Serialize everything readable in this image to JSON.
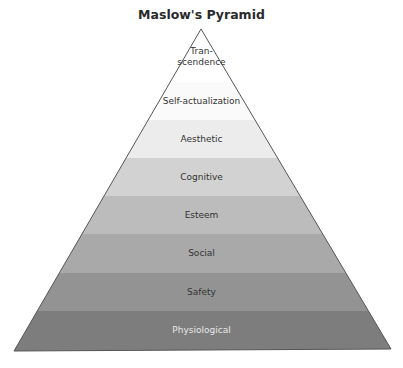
{
  "title": "Maslow's Pyramid",
  "pyramid": {
    "apex": [
      201,
      29
    ],
    "base_left": [
      14,
      351
    ],
    "base_right": [
      391,
      349
    ],
    "levels": [
      {
        "label": "Tran-\nscendence",
        "label_lines": [
          "Tran-",
          "scendence"
        ],
        "y_top": 29,
        "y_bottom": 82,
        "color": "#ffffff",
        "text_color": "#333333"
      },
      {
        "label": "Self-actualization",
        "y_top": 82,
        "y_bottom": 120,
        "color": "#fafafa",
        "text_color": "#333333"
      },
      {
        "label": "Aesthetic",
        "y_top": 120,
        "y_bottom": 158,
        "color": "#ececec",
        "text_color": "#333333"
      },
      {
        "label": "Cognitive",
        "y_top": 158,
        "y_bottom": 196,
        "color": "#d2d2d2",
        "text_color": "#333333"
      },
      {
        "label": "Esteem",
        "y_top": 196,
        "y_bottom": 234,
        "color": "#bcbcbc",
        "text_color": "#333333"
      },
      {
        "label": "Social",
        "y_top": 234,
        "y_bottom": 273,
        "color": "#a9a9a9",
        "text_color": "#333333"
      },
      {
        "label": "Safety",
        "y_top": 273,
        "y_bottom": 311,
        "color": "#939393",
        "text_color": "#333333"
      },
      {
        "label": "Physiological",
        "y_top": 311,
        "y_bottom": 350,
        "color": "#7d7d7d",
        "text_color": "#e8e8e8"
      }
    ]
  }
}
